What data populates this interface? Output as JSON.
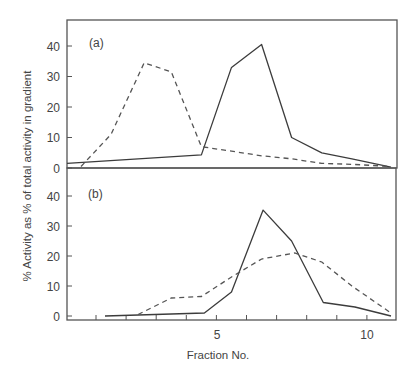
{
  "chart_data": [
    {
      "type": "line",
      "panel": "(a)",
      "title": "",
      "xlabel": "Fraction No.",
      "ylabel": "% Activity as % of total activity in gradient",
      "xlim": [
        0,
        10.9
      ],
      "ylim": [
        0,
        47
      ],
      "yticks": [
        0,
        10,
        20,
        30,
        40
      ],
      "grid": false,
      "legend": null,
      "series": [
        {
          "name": "solid",
          "style": "solid",
          "x": [
            0,
            4.5,
            5.5,
            6.5,
            7.5,
            8.5,
            9.5,
            10.8
          ],
          "y": [
            1.5,
            4.3,
            33,
            40.5,
            10,
            5,
            3,
            0.3
          ]
        },
        {
          "name": "dashed",
          "style": "dashed",
          "x": [
            0.5,
            1.5,
            2.6,
            3.5,
            4.5,
            5.5,
            6.5,
            7.5,
            8.5,
            9.5,
            10.8
          ],
          "y": [
            0.5,
            11,
            34.5,
            31.5,
            7,
            5.5,
            4,
            3,
            1.5,
            1.2,
            0.5
          ]
        }
      ]
    },
    {
      "type": "line",
      "panel": "(b)",
      "title": "",
      "xlabel": "Fraction No.",
      "ylabel": "% Activity as % of total activity in gradient",
      "xlim": [
        0,
        10.9
      ],
      "ylim": [
        0,
        47
      ],
      "yticks": [
        0,
        10,
        20,
        30,
        40
      ],
      "xticks": [
        1,
        2,
        3,
        4,
        5,
        6,
        7,
        8,
        9,
        10
      ],
      "xticklabels": [
        "",
        "",
        "",
        "",
        "5",
        "",
        "",
        "",
        "",
        "10"
      ],
      "grid": false,
      "legend": null,
      "series": [
        {
          "name": "solid",
          "style": "solid",
          "x": [
            1.3,
            4.6,
            5.5,
            6.55,
            7.5,
            8.55,
            9.6,
            10.8
          ],
          "y": [
            0,
            1,
            8,
            35.3,
            25,
            4.5,
            3,
            0
          ]
        },
        {
          "name": "dashed",
          "style": "dashed",
          "x": [
            2.4,
            3.5,
            4.5,
            5.5,
            6.5,
            7.6,
            8.5,
            9.5,
            10.8
          ],
          "y": [
            0.5,
            6,
            6.5,
            13,
            19,
            21,
            18,
            10,
            1
          ]
        }
      ]
    }
  ],
  "labels": {
    "panel_a": "(a)",
    "panel_b": "(b)",
    "xlabel": "Fraction No.",
    "ylabel": "% Activity as % of total activity in gradient",
    "x_tick_5": "5",
    "x_tick_10": "10",
    "y_ticks": [
      "0",
      "10",
      "20",
      "30",
      "40"
    ]
  }
}
